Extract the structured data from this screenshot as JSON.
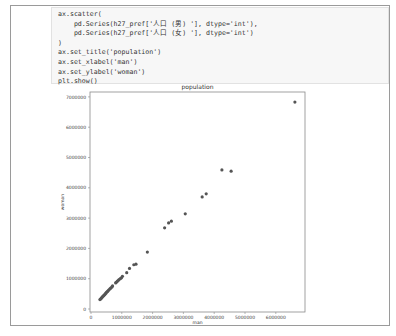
{
  "code_cell": {
    "lines": [
      "ax.scatter(",
      "    pd.Series(h27_pref['人口 (男) '], dtype='int'),",
      "    pd.Series(h27_pref['人口 (女) '], dtype='int')",
      ")",
      "ax.set_title('population')",
      "ax.set_xlabel('man')",
      "ax.set_ylabel('woman')",
      "plt.show()"
    ]
  },
  "chart_data": {
    "type": "scatter",
    "title": "population",
    "xlabel": "man",
    "ylabel": "woman",
    "xlim": [
      -50000,
      6900000
    ],
    "ylim": [
      -100000,
      7250000
    ],
    "xticks": [
      "0",
      "1000000",
      "2000000",
      "3000000",
      "4000000",
      "5000000",
      "6000000"
    ],
    "yticks": [
      "0",
      "1000000",
      "2000000",
      "3000000",
      "4000000",
      "5000000",
      "6000000",
      "7000000"
    ],
    "grid": false,
    "marker_color": "#555555",
    "points": [
      [
        6620000,
        6830000
      ],
      [
        4250000,
        4590000
      ],
      [
        4550000,
        4550000
      ],
      [
        3610000,
        3700000
      ],
      [
        3740000,
        3800000
      ],
      [
        3060000,
        3140000
      ],
      [
        2390000,
        2680000
      ],
      [
        2520000,
        2840000
      ],
      [
        2610000,
        2900000
      ],
      [
        1830000,
        1880000
      ],
      [
        1460000,
        1480000
      ],
      [
        1390000,
        1460000
      ],
      [
        1250000,
        1340000
      ],
      [
        1160000,
        1200000
      ],
      [
        1020000,
        1080000
      ],
      [
        990000,
        1030000
      ],
      [
        950000,
        1000000
      ],
      [
        910000,
        970000
      ],
      [
        880000,
        940000
      ],
      [
        850000,
        910000
      ],
      [
        820000,
        880000
      ],
      [
        800000,
        860000
      ],
      [
        700000,
        760000
      ],
      [
        680000,
        730000
      ],
      [
        650000,
        700000
      ],
      [
        620000,
        670000
      ],
      [
        590000,
        640000
      ],
      [
        560000,
        610000
      ],
      [
        540000,
        580000
      ],
      [
        510000,
        560000
      ],
      [
        490000,
        530000
      ],
      [
        470000,
        510000
      ],
      [
        450000,
        480000
      ],
      [
        430000,
        460000
      ],
      [
        410000,
        440000
      ],
      [
        390000,
        420000
      ],
      [
        370000,
        400000
      ],
      [
        350000,
        380000
      ],
      [
        330000,
        350000
      ],
      [
        310000,
        330000
      ],
      [
        290000,
        310000
      ]
    ]
  }
}
